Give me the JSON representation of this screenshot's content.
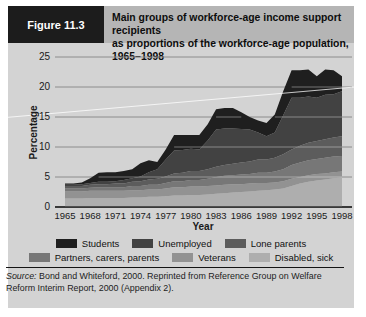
{
  "header": {
    "figure_label": "Figure 11.3",
    "title_line1": "Main groups of workforce-age income support recipients",
    "title_line2": "as proportions of the workforce-age population, 1965–1998"
  },
  "chart_data": {
    "type": "area",
    "stacked": true,
    "title": "Main groups of workforce-age income support recipients as proportions of the workforce-age population, 1965–1998",
    "xlabel": "Year",
    "ylabel": "Percentage",
    "ylim": [
      0,
      25
    ],
    "yticks": [
      0,
      5,
      10,
      15,
      20,
      25
    ],
    "xticks": [
      1965,
      1968,
      1971,
      1974,
      1977,
      1980,
      1983,
      1986,
      1989,
      1992,
      1995,
      1998
    ],
    "grid": "horizontal",
    "x": [
      1965,
      1966,
      1967,
      1968,
      1969,
      1970,
      1971,
      1972,
      1973,
      1974,
      1975,
      1976,
      1977,
      1978,
      1979,
      1980,
      1981,
      1982,
      1983,
      1984,
      1985,
      1986,
      1987,
      1988,
      1989,
      1990,
      1991,
      1992,
      1993,
      1994,
      1995,
      1996,
      1997,
      1998
    ],
    "series_note": "series listed bottom-to-top in stack order; values are percentages of workforce-age population (estimated from figure)",
    "series": [
      {
        "name": "Disabled, sick",
        "color": "#aeaeae",
        "values": [
          1.4,
          1.4,
          1.4,
          1.5,
          1.5,
          1.5,
          1.5,
          1.5,
          1.6,
          1.6,
          1.7,
          1.7,
          1.8,
          1.9,
          1.9,
          2.0,
          2.0,
          2.1,
          2.2,
          2.3,
          2.4,
          2.5,
          2.6,
          2.7,
          2.8,
          2.9,
          3.1,
          3.5,
          3.9,
          4.2,
          4.4,
          4.6,
          4.8,
          4.9
        ]
      },
      {
        "name": "Veterans",
        "color": "#929292",
        "values": [
          1.2,
          1.2,
          1.2,
          1.2,
          1.2,
          1.2,
          1.2,
          1.2,
          1.2,
          1.2,
          1.2,
          1.2,
          1.3,
          1.4,
          1.4,
          1.4,
          1.4,
          1.4,
          1.4,
          1.4,
          1.4,
          1.3,
          1.3,
          1.3,
          1.2,
          1.2,
          1.2,
          1.2,
          1.1,
          1.1,
          1.1,
          1.0,
          1.0,
          1.0
        ]
      },
      {
        "name": "Partners, carers, parents",
        "color": "#777777",
        "values": [
          0.5,
          0.5,
          0.5,
          0.5,
          0.6,
          0.6,
          0.6,
          0.6,
          0.7,
          0.7,
          0.8,
          0.8,
          0.9,
          1.0,
          1.0,
          1.1,
          1.1,
          1.2,
          1.4,
          1.5,
          1.5,
          1.6,
          1.6,
          1.7,
          1.7,
          1.8,
          2.0,
          2.3,
          2.4,
          2.5,
          2.5,
          2.6,
          2.6,
          2.6
        ]
      },
      {
        "name": "Lone parents",
        "color": "#5c5c5c",
        "values": [
          0.4,
          0.4,
          0.4,
          0.5,
          0.5,
          0.5,
          0.6,
          0.6,
          0.7,
          0.8,
          0.9,
          1.0,
          1.1,
          1.3,
          1.4,
          1.5,
          1.5,
          1.6,
          1.7,
          1.8,
          1.9,
          2.0,
          2.1,
          2.2,
          2.2,
          2.3,
          2.5,
          2.6,
          2.8,
          2.9,
          3.0,
          3.1,
          3.2,
          3.3
        ]
      },
      {
        "name": "Unemployed",
        "color": "#424242",
        "values": [
          0.2,
          0.2,
          0.3,
          0.3,
          0.4,
          0.4,
          0.4,
          0.6,
          0.6,
          0.8,
          1.2,
          1.6,
          2.8,
          3.8,
          3.8,
          3.7,
          3.6,
          4.8,
          6.2,
          6.1,
          5.9,
          5.6,
          5.3,
          4.5,
          3.9,
          4.2,
          6.5,
          8.6,
          8.0,
          7.7,
          7.2,
          7.4,
          7.2,
          7.5
        ]
      },
      {
        "name": "Students",
        "color": "#1f1f1f",
        "values": [
          0.2,
          0.2,
          0.3,
          0.8,
          1.5,
          1.6,
          1.5,
          1.5,
          1.5,
          2.2,
          2.0,
          1.2,
          1.7,
          2.6,
          2.5,
          2.3,
          2.4,
          2.7,
          3.4,
          3.4,
          3.4,
          2.8,
          2.1,
          2.0,
          2.2,
          3.0,
          4.0,
          4.6,
          4.6,
          4.5,
          3.6,
          4.2,
          4.0,
          2.5
        ]
      }
    ],
    "legend_position": "bottom",
    "legend_display_order": [
      "Students",
      "Unemployed",
      "Lone parents",
      "Partners, carers, parents",
      "Veterans",
      "Disabled, sick"
    ]
  },
  "legend": {
    "rows": [
      [
        {
          "label": "Students",
          "color": "#1f1f1f"
        },
        {
          "label": "Unemployed",
          "color": "#424242"
        },
        {
          "label": "Lone parents",
          "color": "#5c5c5c"
        }
      ],
      [
        {
          "label": "Partners, carers, parents",
          "color": "#777777"
        },
        {
          "label": "Veterans",
          "color": "#929292"
        },
        {
          "label": "Disabled, sick",
          "color": "#aeaeae"
        }
      ]
    ]
  },
  "axes": {
    "y_label": "Percentage",
    "x_label": "Year"
  },
  "source": {
    "prefix": "Source:",
    "text": "Bond and Whiteford, 2000. Reprinted from Reference Group on Welfare Reform Interim Report, 2000 (Appendix 2)."
  },
  "colors": {
    "figure_background": "#d3d3d3",
    "header_strip": "#b5b5b5",
    "figure_label_box": "#1c1c1c",
    "gridline": "#8c8c8c",
    "baseline": "#2f2f2f"
  }
}
